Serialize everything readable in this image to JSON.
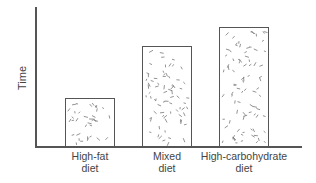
{
  "chart_data": {
    "type": "bar",
    "title": "",
    "xlabel": "",
    "ylabel": "Time",
    "categories": [
      "High-fat diet",
      "Mixed diet",
      "High-carbohydrate diet"
    ],
    "category_lines": [
      [
        "High-fat",
        "diet"
      ],
      [
        "Mixed",
        "diet"
      ],
      [
        "High-carbohydrate",
        "diet"
      ]
    ],
    "values": [
      49,
      101,
      120
    ],
    "value_units": "relative (pixel height, no scale shown)",
    "ylim": [
      0,
      139
    ],
    "grid": false,
    "legend": null,
    "fill_pattern": "random dashes (stipple)",
    "bar_color": "#ffffff",
    "edge_color": "#555555"
  }
}
